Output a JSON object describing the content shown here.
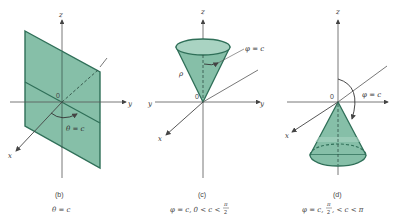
{
  "figure": {
    "colors": {
      "fill": "#86bfa8",
      "fill_light": "#a9d3c2",
      "edge": "#2f6f58",
      "axis": "#555555",
      "text": "#333333"
    },
    "panels": [
      {
        "id": "b",
        "label": "(b)",
        "caption": "θ = c",
        "shape": "half-plane",
        "axes": {
          "z": "z",
          "y": "y",
          "x": "x",
          "origin": "0"
        },
        "annotation": "θ = c"
      },
      {
        "id": "c",
        "label": "(c)",
        "caption_main": "φ = c, 0 < c <",
        "caption_frac_num": "π",
        "caption_frac_den": "2",
        "shape": "cone-up",
        "axes": {
          "z": "z",
          "y": "y",
          "x": "x",
          "origin": "0"
        },
        "annotation": "φ = c",
        "radius_label": "ρ"
      },
      {
        "id": "d",
        "label": "(d)",
        "caption_pre": "φ = c,",
        "caption_frac_num": "π",
        "caption_frac_den": "2",
        "caption_post": ", < c < π",
        "shape": "cone-down",
        "axes": {
          "z": "z",
          "y": "y",
          "x": "x",
          "origin": "0"
        },
        "annotation": "φ = c"
      }
    ]
  }
}
